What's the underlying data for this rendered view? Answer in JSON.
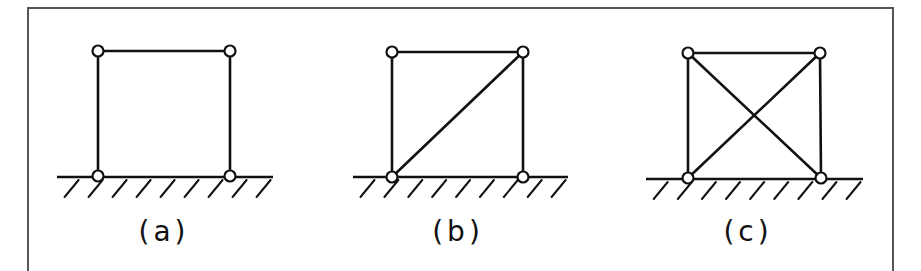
{
  "figure": {
    "frame": {
      "left": 28,
      "top": 8,
      "right": 893,
      "color": "#555555"
    },
    "ink_color": "#111111",
    "node_radius": 5.5,
    "panels": [
      {
        "id": "a",
        "label": "(a)",
        "description": "Square frame with four pinned joints, no diagonal bracing (mechanism)",
        "label_x": 164,
        "nodes": {
          "top_left": [
            98,
            51
          ],
          "top_right": [
            230,
            51
          ],
          "bottom_left": [
            98,
            176
          ],
          "bottom_right": [
            230,
            176
          ]
        },
        "members": [
          [
            "top_left",
            "top_right"
          ],
          [
            "top_left",
            "bottom_left"
          ],
          [
            "top_right",
            "bottom_right"
          ]
        ],
        "ground": {
          "y": 177,
          "x1": 57,
          "x2": 273,
          "hatch_count": 9
        }
      },
      {
        "id": "b",
        "label": "(b)",
        "description": "Square frame with one diagonal brace from bottom-left to top-right (statically determinate)",
        "label_x": 458,
        "nodes": {
          "top_left": [
            392,
            52
          ],
          "top_right": [
            523,
            52
          ],
          "bottom_left": [
            392,
            177
          ],
          "bottom_right": [
            523,
            177
          ]
        },
        "members": [
          [
            "top_left",
            "top_right"
          ],
          [
            "top_left",
            "bottom_left"
          ],
          [
            "top_right",
            "bottom_right"
          ],
          [
            "bottom_left",
            "top_right"
          ]
        ],
        "ground": {
          "y": 177,
          "x1": 353,
          "x2": 568,
          "hatch_count": 9
        }
      },
      {
        "id": "c",
        "label": "(c)",
        "description": "Square frame with two crossing diagonal braces (statically indeterminate)",
        "label_x": 748,
        "nodes": {
          "top_left": [
            688,
            53
          ],
          "top_right": [
            820,
            53
          ],
          "bottom_left": [
            688,
            178
          ],
          "bottom_right": [
            821,
            178
          ]
        },
        "members": [
          [
            "top_left",
            "top_right"
          ],
          [
            "top_left",
            "bottom_left"
          ],
          [
            "top_right",
            "bottom_right"
          ],
          [
            "bottom_left",
            "top_right"
          ],
          [
            "top_left",
            "bottom_right"
          ]
        ],
        "ground": {
          "y": 179,
          "x1": 646,
          "x2": 863,
          "hatch_count": 9
        }
      }
    ]
  }
}
